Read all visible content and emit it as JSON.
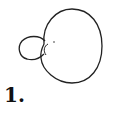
{
  "figure": {
    "label": "1.",
    "stroke_color": "#222222",
    "background": "#ffffff"
  }
}
